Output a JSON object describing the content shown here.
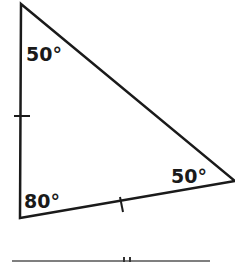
{
  "diagram": {
    "type": "triangle",
    "stroke_color": "#1a1a1a",
    "angles": {
      "top": "50°",
      "bottom_left": "80°",
      "right": "50°"
    },
    "tick_marks": {
      "left_side": "single",
      "bottom_side": "single",
      "partial_bottom_line": "double"
    }
  }
}
